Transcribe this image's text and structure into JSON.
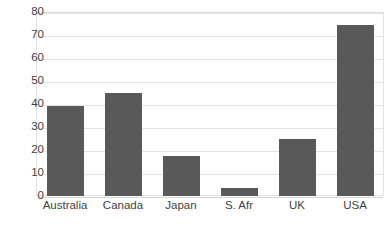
{
  "chart_data": {
    "type": "bar",
    "title": "",
    "subtitle": "",
    "xlabel": "",
    "ylabel": "",
    "categories": [
      "Australia",
      "Canada",
      "Japan",
      "S. Afr",
      "UK",
      "USA"
    ],
    "values": [
      39,
      45,
      17.5,
      3.5,
      25,
      74.5
    ],
    "series": [
      {
        "name": "",
        "values": [
          39,
          45,
          17.5,
          3.5,
          25,
          74.5
        ]
      }
    ],
    "ylim": [
      0,
      80
    ],
    "yticks": [
      0,
      10,
      20,
      30,
      40,
      50,
      60,
      70,
      80
    ],
    "ytick_labels": [
      "0",
      "10",
      "20",
      "30",
      "40",
      "50",
      "60",
      "70",
      "80"
    ],
    "grid": true,
    "grid_axis": "y",
    "legend": false,
    "legend_position": "none",
    "annotations": [],
    "colors": {
      "bar_fill": "#595959",
      "gridline": "#e4e4e4",
      "plot_border": "#e2e2e2",
      "axis_text": "#3f3f3f",
      "background": "#ffffff"
    }
  }
}
